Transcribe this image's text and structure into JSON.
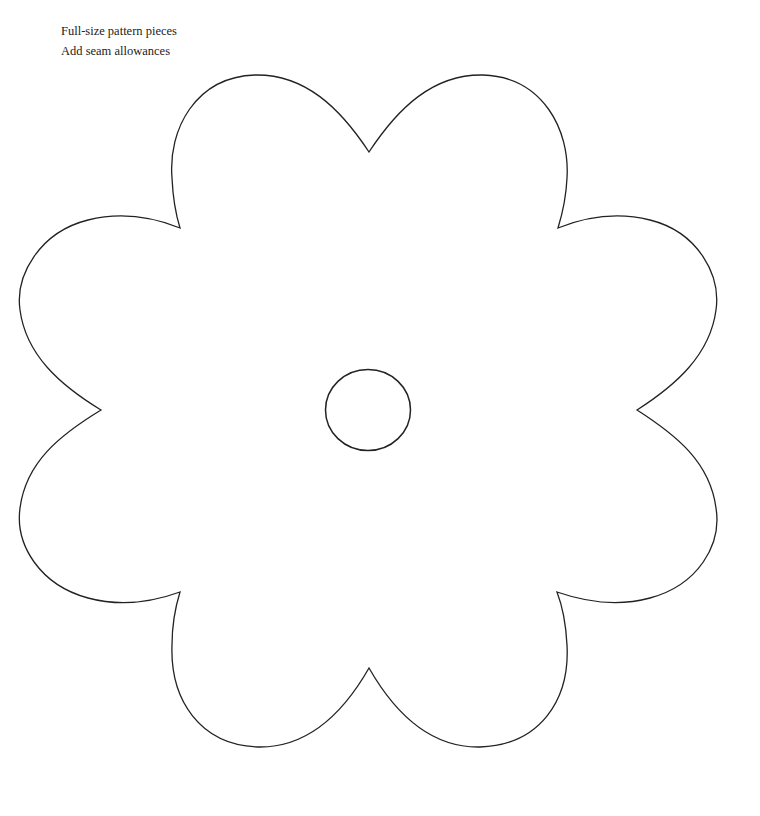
{
  "captions": {
    "line1": "Full-size pattern pieces",
    "line2": "Add seam allowances"
  },
  "pattern": {
    "shape": "six-petal flower outline",
    "center_piece": "circle",
    "stroke_color": "#222222",
    "background_color": "#ffffff"
  }
}
